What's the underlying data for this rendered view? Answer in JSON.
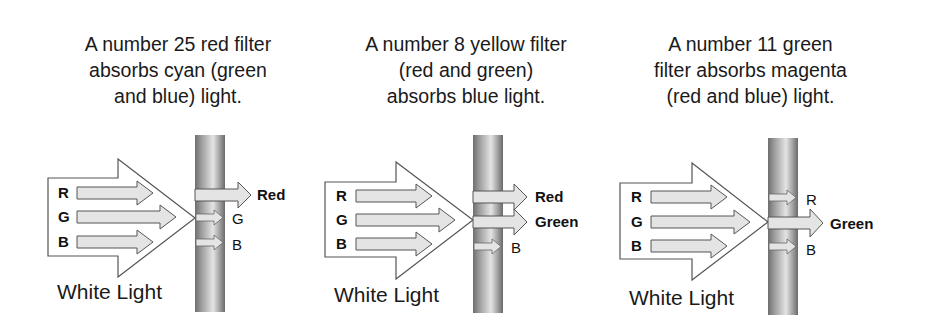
{
  "panels": [
    {
      "id": "red-filter",
      "caption": [
        "A number 25 red filter",
        "absorbs cyan (green",
        "and blue) light."
      ],
      "input_label": "White Light",
      "input_channels": [
        "R",
        "G",
        "B"
      ],
      "outputs": [
        {
          "label": "Red",
          "passed": true
        },
        {
          "label": "G",
          "passed": false
        },
        {
          "label": "B",
          "passed": false
        }
      ]
    },
    {
      "id": "yellow-filter",
      "caption": [
        "A number 8 yellow filter",
        "(red and green)",
        "absorbs blue light."
      ],
      "input_label": "White Light",
      "input_channels": [
        "R",
        "G",
        "B"
      ],
      "outputs": [
        {
          "label": "Red",
          "passed": true
        },
        {
          "label": "Green",
          "passed": true
        },
        {
          "label": "B",
          "passed": false
        }
      ]
    },
    {
      "id": "green-filter",
      "caption": [
        "A number 11 green",
        "filter absorbs magenta",
        "(red and blue) light."
      ],
      "input_label": "White Light",
      "input_channels": [
        "R",
        "G",
        "B"
      ],
      "outputs": [
        {
          "label": "R",
          "passed": false
        },
        {
          "label": "Green",
          "passed": true
        },
        {
          "label": "B",
          "passed": false
        }
      ]
    }
  ],
  "colors": {
    "arrow_fill": "#e4e4e4",
    "arrow_stroke": "#555555",
    "filter_edge": "#6e6e6e",
    "filter_highlight": "#e2e2e2",
    "text": "#111111"
  }
}
